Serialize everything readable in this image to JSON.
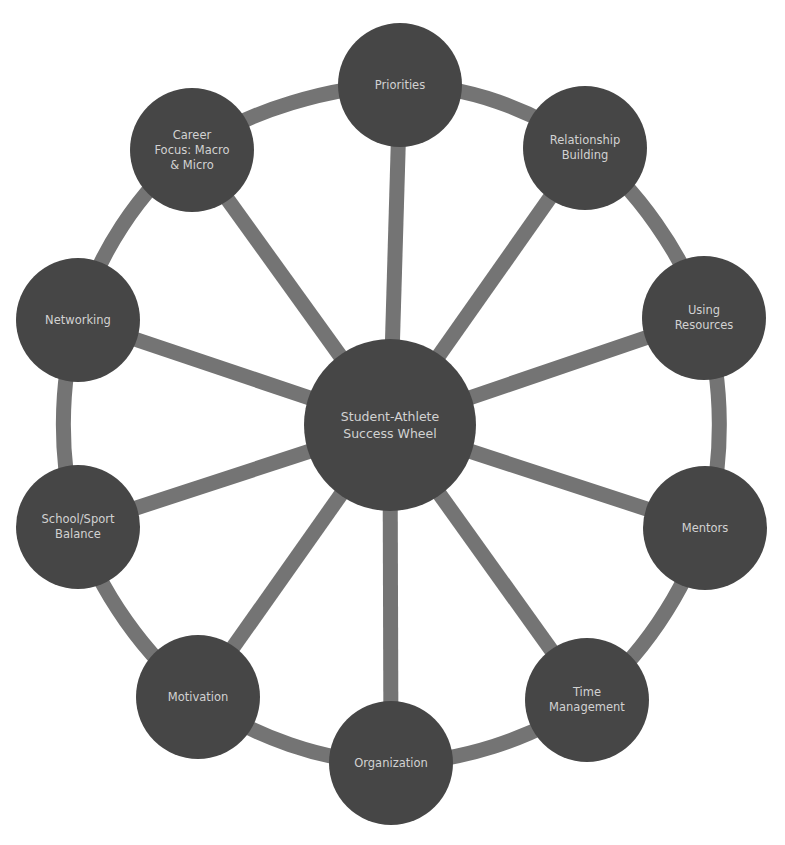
{
  "diagram": {
    "title": "Student-Athlete Success Wheel",
    "colors": {
      "node_fill": "#464646",
      "spoke": "#747474",
      "ring": "#747474",
      "text": "#d2d2d2",
      "background": "#ffffff"
    },
    "center": {
      "label": "Student-Athlete\nSuccess Wheel",
      "x": 390,
      "y": 425,
      "r": 86
    },
    "nodes": [
      {
        "label": "Priorities",
        "x": 400,
        "y": 85
      },
      {
        "label": "Relationship\nBuilding",
        "x": 585,
        "y": 148
      },
      {
        "label": "Using\nResources",
        "x": 704,
        "y": 318
      },
      {
        "label": "Mentors",
        "x": 705,
        "y": 528
      },
      {
        "label": "Time\nManagement",
        "x": 587,
        "y": 700
      },
      {
        "label": "Organization",
        "x": 391,
        "y": 763
      },
      {
        "label": "Motivation",
        "x": 198,
        "y": 697
      },
      {
        "label": "School/Sport\nBalance",
        "x": 78,
        "y": 527
      },
      {
        "label": "Networking",
        "x": 78,
        "y": 320
      },
      {
        "label": "Career\nFocus: Macro\n& Micro",
        "x": 192,
        "y": 150
      }
    ],
    "node_r": 62
  }
}
